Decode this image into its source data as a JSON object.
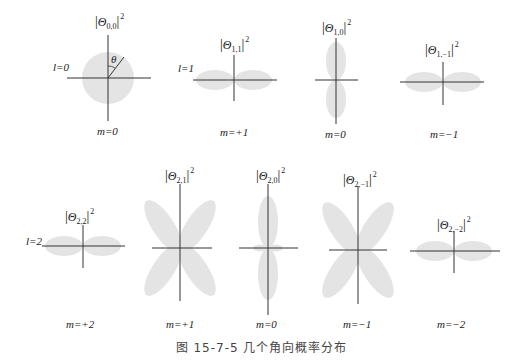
{
  "figure": {
    "caption": "图 15-7-5   几个角向概率分布",
    "lobe_color": "#e4e4e4",
    "axis_color": "#333333",
    "theta_symbol": "θ"
  },
  "panels": [
    {
      "id": "p00",
      "l_label": "l=0",
      "m_label": "m=0",
      "label_sym": "Θ",
      "label_sub": "0,0",
      "label_sup": "2"
    },
    {
      "id": "p11",
      "l_label": "l=1",
      "m_label": "m=+1",
      "label_sym": "Θ",
      "label_sub": "1,1",
      "label_sup": "2"
    },
    {
      "id": "p10",
      "m_label": "m=0",
      "label_sym": "Θ",
      "label_sub": "1,0",
      "label_sup": "2"
    },
    {
      "id": "p1m1",
      "m_label": "m=−1",
      "label_sym": "Θ",
      "label_sub": "1,−1",
      "label_sup": "2"
    },
    {
      "id": "p22",
      "l_label": "l=2",
      "m_label": "m=+2",
      "label_sym": "Θ",
      "label_sub": "2,2",
      "label_sup": "2"
    },
    {
      "id": "p21",
      "m_label": "m=+1",
      "label_sym": "Θ",
      "label_sub": "2,1",
      "label_sup": "2"
    },
    {
      "id": "p20",
      "m_label": "m=0",
      "label_sym": "Θ",
      "label_sub": "2,0",
      "label_sup": "2"
    },
    {
      "id": "p2m1",
      "m_label": "m=−1",
      "label_sym": "Θ",
      "label_sub": "2,−1",
      "label_sup": "2"
    },
    {
      "id": "p2m2",
      "m_label": "m=−2",
      "label_sym": "Θ",
      "label_sub": "2,−2",
      "label_sup": "2"
    }
  ]
}
